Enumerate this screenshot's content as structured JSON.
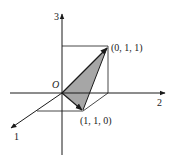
{
  "diagram": {
    "type": "3d-vector-diagram",
    "axes": [
      {
        "id": "1",
        "label": "1"
      },
      {
        "id": "2",
        "label": "2"
      },
      {
        "id": "3",
        "label": "3"
      }
    ],
    "origin_label": "O",
    "points": [
      {
        "id": "p011",
        "label": "(0, 1, 1)"
      },
      {
        "id": "p110",
        "label": "(1, 1, 0)"
      }
    ],
    "shaded_region": "triangle O-(0,1,1)-(1,1,0)",
    "colors": {
      "line": "#1a1a1a",
      "shade": "#a6a6a6",
      "background": "#ffffff"
    }
  }
}
